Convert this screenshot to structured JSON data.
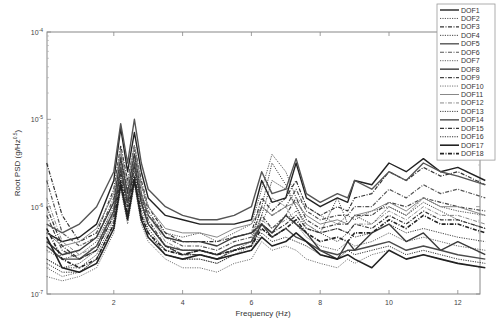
{
  "chart_data": {
    "type": "line",
    "title": "",
    "xlabel": "Frequency (Hz)",
    "ylabel": "Root PSD (g/Hz^0.5)",
    "xlim": [
      0.05,
      12.8
    ],
    "ylim": [
      1e-07,
      0.0001
    ],
    "yscale": "log",
    "grid": false,
    "legend_position": "top-right",
    "x_ticks": [
      2,
      4,
      6,
      8,
      10,
      12
    ],
    "y_ticks": [
      "10^-7",
      "10^-6",
      "10^-5",
      "10^-4"
    ],
    "x": [
      0.05,
      0.5,
      1,
      1.5,
      2,
      2.2,
      2.4,
      2.6,
      2.8,
      3,
      3.5,
      4,
      4.5,
      5,
      5.5,
      6,
      6.3,
      6.6,
      7,
      7.3,
      7.6,
      8,
      8.5,
      8.8,
      9,
      9.5,
      10,
      10.5,
      11,
      11.5,
      12,
      12.8
    ],
    "series_note": "values are log10(Root PSD)",
    "series": [
      {
        "name": "DOF1",
        "style": "solid",
        "width": 1.4,
        "color": "#222222",
        "values": [
          -6.3,
          -6.4,
          -6.35,
          -6.2,
          -5.7,
          -5.1,
          -5.6,
          -5.15,
          -5.6,
          -5.9,
          -6.1,
          -6.15,
          -6.2,
          -6.2,
          -6.2,
          -6.15,
          -5.7,
          -5.95,
          -5.9,
          -5.5,
          -5.9,
          -6.0,
          -5.9,
          -5.95,
          -5.7,
          -5.75,
          -5.5,
          -5.6,
          -5.45,
          -5.6,
          -5.55,
          -5.7
        ]
      },
      {
        "name": "DOF2",
        "style": "dotted",
        "width": 1.0,
        "color": "#555555",
        "values": [
          -6.5,
          -6.6,
          -6.55,
          -6.4,
          -6.0,
          -5.5,
          -5.9,
          -5.4,
          -5.9,
          -6.1,
          -6.3,
          -6.35,
          -6.3,
          -6.4,
          -6.3,
          -6.2,
          -5.8,
          -5.4,
          -5.6,
          -5.9,
          -6.0,
          -6.1,
          -6.2,
          -6.1,
          -6.15,
          -6.05,
          -6.0,
          -6.1,
          -5.9,
          -6.0,
          -6.05,
          -6.1
        ]
      },
      {
        "name": "DOF3",
        "style": "dashdot",
        "width": 1.2,
        "color": "#333333",
        "values": [
          -5.5,
          -6.1,
          -6.4,
          -6.3,
          -5.8,
          -5.3,
          -5.7,
          -5.3,
          -5.7,
          -6.0,
          -6.3,
          -6.4,
          -6.4,
          -6.4,
          -6.35,
          -6.3,
          -5.9,
          -6.05,
          -5.9,
          -5.7,
          -6.0,
          -6.1,
          -6.0,
          -6.05,
          -5.9,
          -5.85,
          -5.6,
          -5.7,
          -5.55,
          -5.65,
          -5.6,
          -5.75
        ]
      },
      {
        "name": "DOF4",
        "style": "dotted",
        "width": 1.0,
        "color": "#444444",
        "values": [
          -6.6,
          -6.7,
          -6.65,
          -6.5,
          -6.1,
          -5.6,
          -6.0,
          -5.55,
          -6.0,
          -6.2,
          -6.45,
          -6.5,
          -6.5,
          -6.55,
          -6.45,
          -6.4,
          -6.1,
          -5.7,
          -5.8,
          -6.0,
          -6.2,
          -6.3,
          -6.4,
          -6.3,
          -6.35,
          -6.3,
          -6.2,
          -6.3,
          -6.25,
          -6.3,
          -6.35,
          -6.4
        ]
      },
      {
        "name": "DOF5",
        "style": "solid",
        "width": 1.4,
        "color": "#555555",
        "values": [
          -6.2,
          -6.3,
          -6.2,
          -6.0,
          -5.6,
          -5.05,
          -5.5,
          -5.0,
          -5.5,
          -5.8,
          -6.0,
          -6.1,
          -6.15,
          -6.15,
          -6.1,
          -6.0,
          -5.6,
          -5.85,
          -5.8,
          -5.45,
          -5.85,
          -5.95,
          -5.85,
          -5.9,
          -5.7,
          -5.8,
          -5.6,
          -5.7,
          -5.5,
          -5.6,
          -5.65,
          -5.75
        ]
      },
      {
        "name": "DOF6",
        "style": "dashdot",
        "width": 1.2,
        "color": "#555555",
        "values": [
          -5.7,
          -6.3,
          -6.45,
          -6.35,
          -5.9,
          -5.4,
          -5.8,
          -5.35,
          -5.75,
          -6.05,
          -6.35,
          -6.45,
          -6.45,
          -6.5,
          -6.4,
          -6.35,
          -6.0,
          -6.1,
          -6.0,
          -5.8,
          -6.05,
          -6.15,
          -6.1,
          -6.1,
          -6.0,
          -6.0,
          -5.8,
          -5.9,
          -5.75,
          -5.85,
          -5.8,
          -5.9
        ]
      },
      {
        "name": "DOF7",
        "style": "dotted",
        "width": 1.0,
        "color": "#666666",
        "values": [
          -6.7,
          -6.8,
          -6.75,
          -6.6,
          -6.2,
          -5.7,
          -6.1,
          -5.65,
          -6.1,
          -6.3,
          -6.55,
          -6.6,
          -6.6,
          -6.65,
          -6.55,
          -6.45,
          -6.2,
          -5.9,
          -6.0,
          -6.2,
          -6.35,
          -6.45,
          -6.5,
          -6.4,
          -6.45,
          -6.4,
          -6.3,
          -6.4,
          -6.35,
          -6.4,
          -6.45,
          -6.5
        ]
      },
      {
        "name": "DOF8",
        "style": "solid",
        "width": 1.4,
        "color": "#3a3a3a",
        "values": [
          -6.4,
          -6.55,
          -6.5,
          -6.35,
          -5.95,
          -5.45,
          -5.85,
          -5.4,
          -5.85,
          -6.1,
          -6.35,
          -6.4,
          -6.4,
          -6.45,
          -6.35,
          -6.3,
          -6.2,
          -6.3,
          -6.1,
          -6.2,
          -6.3,
          -6.5,
          -6.6,
          -6.4,
          -6.5,
          -6.3,
          -6.2,
          -6.4,
          -6.3,
          -6.5,
          -6.4,
          -6.55
        ]
      },
      {
        "name": "DOF9",
        "style": "dashdot",
        "width": 1.2,
        "color": "#444444",
        "values": [
          -6.1,
          -6.5,
          -6.6,
          -6.5,
          -6.05,
          -5.5,
          -5.95,
          -5.45,
          -5.9,
          -6.15,
          -6.45,
          -6.55,
          -6.55,
          -6.6,
          -6.5,
          -6.45,
          -6.1,
          -6.25,
          -6.1,
          -5.9,
          -6.15,
          -6.25,
          -6.2,
          -6.2,
          -6.1,
          -6.1,
          -5.95,
          -6.0,
          -5.9,
          -5.95,
          -6.0,
          -6.05
        ]
      },
      {
        "name": "DOF10",
        "style": "dotted",
        "width": 1.0,
        "color": "#777777",
        "values": [
          -6.8,
          -6.85,
          -6.8,
          -6.7,
          -6.3,
          -5.8,
          -6.2,
          -5.75,
          -6.2,
          -6.4,
          -6.6,
          -6.7,
          -6.7,
          -6.75,
          -6.65,
          -6.6,
          -6.4,
          -6.5,
          -6.45,
          -6.5,
          -6.6,
          -6.65,
          -6.7,
          -6.6,
          -6.65,
          -6.55,
          -6.5,
          -6.6,
          -6.55,
          -6.6,
          -6.65,
          -6.7
        ]
      },
      {
        "name": "DOF11",
        "style": "solid",
        "width": 1.0,
        "color": "#888888",
        "values": [
          -6.3,
          -6.45,
          -6.4,
          -6.25,
          -5.85,
          -5.35,
          -5.75,
          -5.3,
          -5.75,
          -6.0,
          -6.25,
          -6.3,
          -6.3,
          -6.35,
          -6.25,
          -6.2,
          -6.0,
          -6.1,
          -6.0,
          -5.95,
          -6.1,
          -6.2,
          -6.15,
          -6.2,
          -6.1,
          -6.05,
          -5.95,
          -6.05,
          -5.9,
          -6.0,
          -6.0,
          -6.1
        ]
      },
      {
        "name": "DOF12",
        "style": "dashdot",
        "width": 1.0,
        "color": "#888888",
        "values": [
          -5.9,
          -6.4,
          -6.55,
          -6.45,
          -6.0,
          -5.5,
          -5.9,
          -5.45,
          -5.85,
          -6.1,
          -6.4,
          -6.5,
          -6.5,
          -6.55,
          -6.45,
          -6.4,
          -6.15,
          -6.25,
          -6.15,
          -6.05,
          -6.2,
          -6.3,
          -6.25,
          -6.3,
          -6.2,
          -6.2,
          -6.05,
          -6.15,
          -6.0,
          -6.1,
          -6.1,
          -6.2
        ]
      },
      {
        "name": "DOF13",
        "style": "dotted",
        "width": 1.0,
        "color": "#444444",
        "values": [
          -6.6,
          -6.7,
          -6.7,
          -6.55,
          -6.15,
          -5.65,
          -6.05,
          -5.6,
          -6.05,
          -6.25,
          -6.5,
          -6.55,
          -6.55,
          -6.6,
          -6.5,
          -6.4,
          -6.0,
          -5.5,
          -5.75,
          -6.0,
          -6.25,
          -6.3,
          -5.9,
          -6.2,
          -6.1,
          -6.2,
          -6.0,
          -6.1,
          -5.95,
          -6.05,
          -6.15,
          -6.25
        ]
      },
      {
        "name": "DOF14",
        "style": "solid",
        "width": 1.4,
        "color": "#4a4a4a",
        "values": [
          -6.45,
          -6.6,
          -6.6,
          -6.45,
          -6.05,
          -5.55,
          -5.95,
          -5.5,
          -5.95,
          -6.2,
          -6.45,
          -6.5,
          -6.5,
          -6.55,
          -6.45,
          -6.4,
          -6.2,
          -6.35,
          -6.25,
          -6.35,
          -6.4,
          -6.5,
          -6.55,
          -6.5,
          -6.5,
          -6.45,
          -6.4,
          -6.5,
          -6.45,
          -6.5,
          -6.55,
          -6.6
        ]
      },
      {
        "name": "DOF15",
        "style": "dashdot",
        "width": 1.2,
        "color": "#333333",
        "values": [
          -6.0,
          -6.45,
          -6.6,
          -6.5,
          -6.1,
          -5.6,
          -6.0,
          -5.55,
          -5.95,
          -6.2,
          -6.45,
          -6.55,
          -6.5,
          -6.55,
          -6.5,
          -6.45,
          -6.2,
          -6.3,
          -6.2,
          -6.1,
          -6.25,
          -6.3,
          -6.25,
          -6.3,
          -6.2,
          -6.25,
          -6.1,
          -6.2,
          -6.05,
          -6.15,
          -6.15,
          -6.25
        ]
      },
      {
        "name": "DOF16",
        "style": "dotted",
        "width": 1.0,
        "color": "#333333",
        "values": [
          -6.65,
          -6.75,
          -6.75,
          -6.6,
          -6.2,
          -5.7,
          -6.1,
          -5.65,
          -6.1,
          -6.3,
          -6.55,
          -6.6,
          -6.6,
          -6.65,
          -6.55,
          -6.5,
          -6.3,
          -6.4,
          -6.35,
          -6.4,
          -6.45,
          -6.55,
          -6.6,
          -6.5,
          -6.55,
          -6.5,
          -6.45,
          -6.55,
          -6.5,
          -6.55,
          -6.6,
          -6.65
        ]
      },
      {
        "name": "DOF17",
        "style": "solid",
        "width": 1.6,
        "color": "#222222",
        "values": [
          -6.35,
          -6.7,
          -6.75,
          -6.65,
          -6.25,
          -5.75,
          -6.15,
          -5.7,
          -6.15,
          -6.35,
          -6.55,
          -6.6,
          -6.55,
          -6.6,
          -6.55,
          -6.5,
          -6.35,
          -6.45,
          -6.4,
          -6.3,
          -6.4,
          -6.55,
          -6.6,
          -6.55,
          -6.6,
          -6.7,
          -6.5,
          -6.6,
          -6.55,
          -6.6,
          -6.65,
          -6.7
        ]
      },
      {
        "name": "DOF18",
        "style": "dashdot",
        "width": 1.6,
        "color": "#222222",
        "values": [
          -6.25,
          -6.6,
          -6.7,
          -6.6,
          -6.2,
          -5.7,
          -6.1,
          -5.65,
          -6.1,
          -6.3,
          -6.5,
          -6.55,
          -6.5,
          -6.55,
          -6.5,
          -6.45,
          -6.25,
          -6.35,
          -6.25,
          -6.15,
          -6.3,
          -6.4,
          -6.35,
          -6.4,
          -6.3,
          -6.3,
          -6.15,
          -6.25,
          -6.1,
          -6.2,
          -6.2,
          -6.3
        ]
      }
    ]
  }
}
